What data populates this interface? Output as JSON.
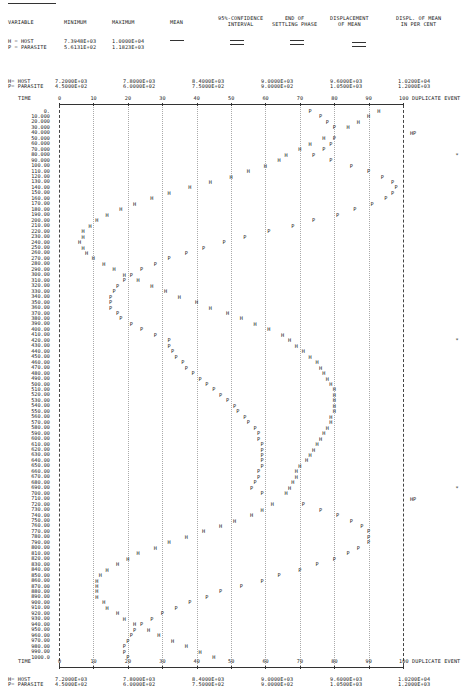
{
  "summary_table": {
    "headers": [
      "VARIABLE",
      "MINIMUM",
      "MAXIMUM",
      "MEAN",
      "95%-CONFIDENCE\nINTERVAL",
      "END OF\nSETTLING PHASE",
      "DISPLACEMENT\nOF MEAN",
      "DISPL. OF MEAN\nIN PER CENT"
    ],
    "rows": [
      {
        "variable": "H = HOST",
        "minimum": "7.3948E+03",
        "maximum": "1.0000E+04"
      },
      {
        "variable": "P = PARASITE",
        "minimum": "5.6131E+02",
        "maximum": "1.1823E+03"
      }
    ]
  },
  "scale_header": {
    "legend": [
      "H= HOST",
      "P= PARASITE"
    ],
    "host_scale": [
      "7.2000E+03",
      "7.8000E+03",
      "8.4000E+03",
      "9.0000E+03",
      "9.6000E+03",
      "1.0200E+04"
    ],
    "parasite_scale": [
      "4.5000E+02",
      "6.0000E+02",
      "7.5000E+02",
      "9.0000E+02",
      "1.0500E+03",
      "1.2000E+03"
    ],
    "time_label": "TIME",
    "duplicate_label": "DUPLICATE EVENT"
  },
  "chart_data": {
    "type": "scatter",
    "title": "",
    "xlabel": "relative scale 0-100 (H: 7.2E+03 to 1.02E+04, P: 4.5E+02 to 1.2E+03)",
    "ylabel": "TIME",
    "xlim": [
      0,
      100
    ],
    "ylim": [
      0,
      1000
    ],
    "x_ticks": [
      0,
      10,
      20,
      30,
      40,
      50,
      60,
      70,
      80,
      90,
      100
    ],
    "grid": true,
    "time": [
      0,
      10,
      20,
      30,
      40,
      50,
      60,
      70,
      80,
      90,
      100,
      110,
      120,
      130,
      140,
      150,
      160,
      170,
      180,
      190,
      200,
      210,
      220,
      230,
      240,
      250,
      260,
      270,
      280,
      290,
      300,
      310,
      320,
      330,
      340,
      350,
      360,
      370,
      380,
      390,
      400,
      410,
      420,
      430,
      440,
      450,
      460,
      470,
      480,
      490,
      500,
      510,
      520,
      530,
      540,
      550,
      560,
      570,
      580,
      590,
      600,
      610,
      620,
      630,
      640,
      650,
      660,
      670,
      680,
      690,
      700,
      710,
      720,
      730,
      740,
      750,
      760,
      770,
      780,
      790,
      800,
      810,
      820,
      830,
      840,
      850,
      860,
      870,
      880,
      890,
      900,
      910,
      920,
      930,
      940,
      950,
      960,
      970,
      980,
      990,
      1000
    ],
    "time_labels": [
      "0.",
      "10.000",
      "20.000",
      "30.000",
      "40.000",
      "50.000",
      "60.000",
      "70.000",
      "80.000",
      "90.000",
      "100.00",
      "110.00",
      "120.00",
      "130.00",
      "140.00",
      "150.00",
      "160.00",
      "170.00",
      "180.00",
      "190.00",
      "200.00",
      "210.00",
      "220.00",
      "230.00",
      "240.00",
      "250.00",
      "260.00",
      "270.00",
      "280.00",
      "290.00",
      "300.00",
      "310.00",
      "320.00",
      "330.00",
      "340.00",
      "350.00",
      "360.00",
      "370.00",
      "380.00",
      "390.00",
      "400.00",
      "410.00",
      "420.00",
      "430.00",
      "440.00",
      "450.00",
      "460.00",
      "470.00",
      "480.00",
      "490.00",
      "500.00",
      "510.00",
      "520.00",
      "530.00",
      "540.00",
      "550.00",
      "560.00",
      "570.00",
      "580.00",
      "590.00",
      "600.00",
      "610.00",
      "620.00",
      "630.00",
      "640.00",
      "650.00",
      "660.00",
      "670.00",
      "680.00",
      "690.00",
      "700.00",
      "710.00",
      "720.00",
      "730.00",
      "740.00",
      "750.00",
      "760.00",
      "770.00",
      "780.00",
      "790.00",
      "800.00",
      "810.00",
      "820.00",
      "830.00",
      "840.00",
      "850.00",
      "860.00",
      "870.00",
      "880.00",
      "890.00",
      "900.00",
      "910.00",
      "920.00",
      "930.00",
      "940.00",
      "950.00",
      "960.00",
      "970.00",
      "980.00",
      "990.00",
      "1000.0"
    ],
    "series": [
      {
        "name": "H = HOST",
        "symbol": "H",
        "values": [
          93,
          90,
          87,
          84,
          80,
          77,
          73,
          70,
          66,
          64,
          60,
          55,
          50,
          44,
          38,
          32,
          27,
          22,
          18,
          14,
          11,
          9,
          7,
          7,
          6,
          7,
          8,
          10,
          13,
          16,
          19,
          23,
          27,
          31,
          35,
          40,
          44,
          49,
          53,
          57,
          61,
          65,
          67,
          69,
          71,
          73,
          75,
          76,
          77,
          78,
          79,
          80,
          80,
          80,
          80,
          80,
          79,
          79,
          78,
          77,
          76,
          75,
          74,
          73,
          72,
          70,
          69,
          69,
          68,
          67,
          66,
          65,
          62,
          59,
          56,
          51,
          47,
          42,
          37,
          32,
          28,
          23,
          20,
          17,
          14,
          12,
          11,
          11,
          11,
          11,
          13,
          14,
          17,
          19,
          22,
          26,
          29,
          33,
          37,
          41,
          45
        ]
      },
      {
        "name": "P = PARASITE",
        "symbol": "P",
        "values": [
          73,
          76,
          78,
          80,
          80,
          80,
          79,
          77,
          74,
          79,
          85,
          90,
          94,
          97,
          98,
          97,
          95,
          91,
          86,
          81,
          74,
          68,
          61,
          54,
          48,
          42,
          37,
          32,
          28,
          24,
          21,
          19,
          17,
          16,
          15,
          15,
          15,
          17,
          18,
          21,
          24,
          28,
          32,
          32,
          33,
          34,
          36,
          37,
          39,
          41,
          43,
          45,
          47,
          49,
          51,
          52,
          54,
          55,
          57,
          58,
          58,
          59,
          59,
          59,
          59,
          59,
          58,
          58,
          57,
          56,
          59,
          65,
          71,
          76,
          81,
          85,
          88,
          90,
          90,
          90,
          87,
          84,
          80,
          75,
          70,
          64,
          59,
          53,
          47,
          43,
          38,
          34,
          30,
          27,
          24,
          22,
          21,
          20,
          19,
          19,
          20
        ]
      }
    ],
    "duplicate_events": [
      {
        "time": 40,
        "mark": "HP"
      },
      {
        "time": 80,
        "mark": "*"
      },
      {
        "time": 420,
        "mark": "*"
      },
      {
        "time": 690,
        "mark": "*"
      },
      {
        "time": 710,
        "mark": "HP"
      }
    ]
  }
}
